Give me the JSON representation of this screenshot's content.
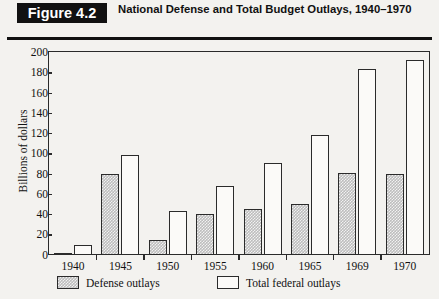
{
  "header": {
    "figure_badge": "Figure 4.2",
    "title": "National Defense and Total Budget Outlays, 1940–1970"
  },
  "chart_data": {
    "type": "bar",
    "title": "National Defense and Total Budget Outlays, 1940–1970",
    "xlabel": "",
    "ylabel": "Billions of dollars",
    "ylim": [
      0,
      200
    ],
    "ytick_step": 20,
    "yticks": [
      0,
      20,
      40,
      60,
      80,
      100,
      120,
      140,
      160,
      180,
      200
    ],
    "grid": false,
    "legend_position": "below-axes-left",
    "categories": [
      "1940",
      "1945",
      "1950",
      "1955",
      "1960",
      "1965",
      "1969",
      "1970"
    ],
    "series": [
      {
        "name": "Defense outlays",
        "color": "#bdbdbd",
        "fill": "hatched-gray",
        "values": [
          1.7,
          80,
          14,
          40,
          45,
          50,
          81,
          80
        ]
      },
      {
        "name": "Total federal outlays",
        "color": "#fbfaf8",
        "fill": "white",
        "values": [
          9.5,
          98,
          43,
          68,
          90,
          118,
          183,
          192
        ]
      }
    ]
  },
  "legend": {
    "items": [
      {
        "label": "Defense outlays",
        "swatch": "defense"
      },
      {
        "label": "Total federal outlays",
        "swatch": "total"
      }
    ]
  }
}
